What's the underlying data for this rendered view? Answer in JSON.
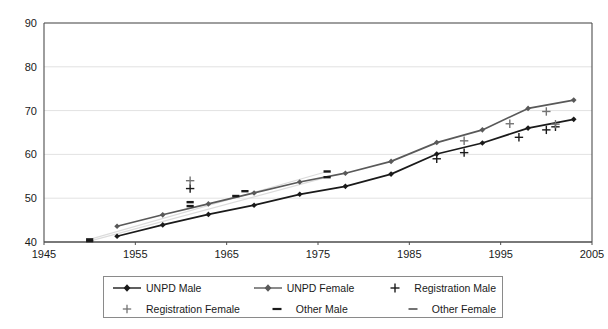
{
  "chart_data": {
    "type": "line",
    "title": "",
    "subtitle": "",
    "xlabel": "",
    "ylabel": "",
    "xlim": [
      1945,
      2005
    ],
    "ylim": [
      40,
      90
    ],
    "xticks": [
      1945,
      1955,
      1965,
      1975,
      1985,
      1995,
      2005
    ],
    "yticks": [
      40,
      50,
      60,
      70,
      80,
      90
    ],
    "grid": "horizontal",
    "legend_position": "bottom",
    "series": [
      {
        "name": "UNPD Male",
        "marker": "diamond",
        "line": "solid",
        "color": "#1a1a1a",
        "points": [
          [
            1953,
            41.3
          ],
          [
            1958,
            43.9
          ],
          [
            1963,
            46.3
          ],
          [
            1968,
            48.4
          ],
          [
            1973,
            50.9
          ],
          [
            1978,
            52.7
          ],
          [
            1983,
            55.5
          ],
          [
            1988,
            60.1
          ],
          [
            1993,
            62.6
          ],
          [
            1998,
            66.0
          ],
          [
            2003,
            68.0
          ]
        ]
      },
      {
        "name": "UNPD Female",
        "marker": "diamond",
        "line": "solid",
        "color": "#595959",
        "points": [
          [
            1953,
            43.6
          ],
          [
            1958,
            46.2
          ],
          [
            1963,
            48.7
          ],
          [
            1968,
            51.2
          ],
          [
            1973,
            53.7
          ],
          [
            1978,
            55.7
          ],
          [
            1983,
            58.4
          ],
          [
            1988,
            62.7
          ],
          [
            1993,
            65.6
          ],
          [
            1998,
            70.5
          ],
          [
            2003,
            72.4
          ]
        ]
      },
      {
        "name": "Registration Male",
        "marker": "plus",
        "line": "none",
        "color": "#1a1a1a",
        "points": [
          [
            1961,
            52.2
          ],
          [
            1988,
            59.0
          ],
          [
            1991,
            60.4
          ],
          [
            1997,
            63.9
          ],
          [
            2000,
            65.6
          ],
          [
            2001,
            66.3
          ]
        ]
      },
      {
        "name": "Registration Female",
        "marker": "plus",
        "line": "none",
        "color": "#737373",
        "points": [
          [
            1961,
            54.0
          ],
          [
            1991,
            63.1
          ],
          [
            1996,
            67.0
          ],
          [
            2000,
            69.8
          ],
          [
            2001,
            66.9
          ]
        ]
      },
      {
        "name": "Other Male",
        "marker": "dash",
        "line": "trend",
        "color": "#1a1a1a",
        "points": [
          [
            1950,
            40.2
          ],
          [
            1961,
            48.2
          ],
          [
            1966,
            50.5
          ],
          [
            1976,
            54.8
          ]
        ]
      },
      {
        "name": "Other Female",
        "marker": "dash",
        "line": "trend",
        "color": "#1a1a1a",
        "points": [
          [
            1950,
            40.6
          ],
          [
            1961,
            49.1
          ],
          [
            1967,
            51.6
          ],
          [
            1976,
            56.1
          ]
        ]
      }
    ]
  },
  "axes": {
    "ytick_labels": [
      "90",
      "80",
      "70",
      "60",
      "50",
      "40"
    ],
    "xtick_labels": [
      "1945",
      "1955",
      "1965",
      "1975",
      "1985",
      "1995",
      "2005"
    ]
  },
  "legend": {
    "items": [
      {
        "label": "UNPD Male",
        "symbol": "line-diamond",
        "color": "#1a1a1a"
      },
      {
        "label": "UNPD Female",
        "symbol": "line-diamond",
        "color": "#595959"
      },
      {
        "label": "Registration Male",
        "symbol": "plus",
        "color": "#1a1a1a"
      },
      {
        "label": "Registration Female",
        "symbol": "plus",
        "color": "#737373"
      },
      {
        "label": "Other Male",
        "symbol": "dash",
        "color": "#1a1a1a"
      },
      {
        "label": "Other Female",
        "symbol": "dash",
        "color": "#737373"
      }
    ]
  },
  "colors": {
    "axis": "#4d4d4d",
    "grid": "#e2e2e2",
    "plot_background": "#ffffff",
    "male": "#1a1a1a",
    "female": "#595959",
    "trend": "#dcdcdc"
  }
}
